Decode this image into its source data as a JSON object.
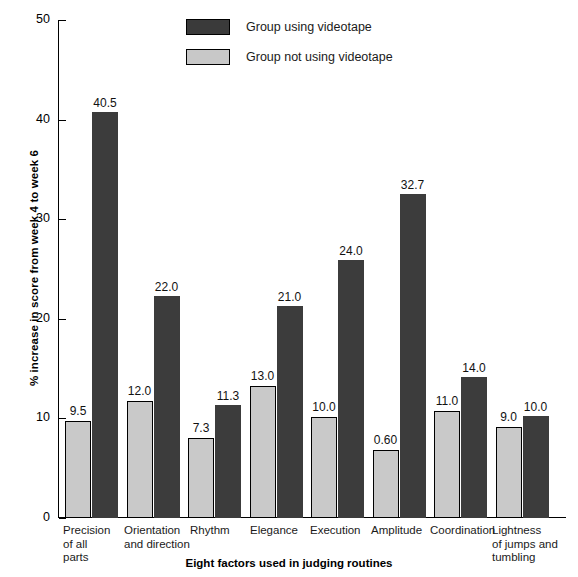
{
  "chart_data": {
    "type": "bar",
    "title": "",
    "xlabel": "Eight factors used in judging routines",
    "ylabel": "% increase in score from week 4 to week 6",
    "ylim": [
      0,
      50
    ],
    "yticks": [
      "0",
      "10",
      "20",
      "30",
      "40",
      "50"
    ],
    "grid": false,
    "legend_position": "top-center",
    "categories": [
      "Precision of all parts",
      "Orientation and direction",
      "Rhythm",
      "Elegance",
      "Execution",
      "Amplitude",
      "Coordination",
      "Lightness of jumps and tumbling"
    ],
    "category_lines": [
      [
        "Precision",
        "of all",
        "parts"
      ],
      [
        "Orientation",
        "and direction"
      ],
      [
        "Rhythm"
      ],
      [
        "Elegance"
      ],
      [
        "Execution"
      ],
      [
        "Amplitude"
      ],
      [
        "Coordination"
      ],
      [
        "Lightness",
        "of jumps and",
        "tumbling"
      ]
    ],
    "series": [
      {
        "name": "Group not using videotape",
        "color": "#c9c9c9",
        "values": [
          9.5,
          12.0,
          7.3,
          13.0,
          10.0,
          0.6,
          11.0,
          9.0
        ],
        "labels": [
          "9.5",
          "12.0",
          "7.3",
          "13.0",
          "10.0",
          "0.60",
          "11.0",
          "9.0"
        ],
        "plotted_heights": [
          9.7,
          11.7,
          8.0,
          13.3,
          10.1,
          6.8,
          10.7,
          9.1
        ]
      },
      {
        "name": "Group using videotape",
        "color": "#3c3c3c",
        "values": [
          40.5,
          22.0,
          11.3,
          21.0,
          24.0,
          32.7,
          14.0,
          10.0
        ],
        "labels": [
          "40.5",
          "22.0",
          "11.3",
          "21.0",
          "24.0",
          "32.7",
          "14.0",
          "10.0"
        ],
        "plotted_heights": [
          40.8,
          22.3,
          11.3,
          21.3,
          25.9,
          32.5,
          14.2,
          10.2
        ]
      }
    ]
  },
  "legend": {
    "items": [
      {
        "label": "Group using videotape",
        "swatch": "dark"
      },
      {
        "label": "Group not using videotape",
        "swatch": "light"
      }
    ]
  },
  "axes": {
    "y_title": "% increase in score from week 4 to week 6",
    "x_title": "Eight factors used in judging routines",
    "y_ticks": [
      {
        "label": "50",
        "value": 50
      },
      {
        "label": "40",
        "value": 40
      },
      {
        "label": "30",
        "value": 30
      },
      {
        "label": "20",
        "value": 20
      },
      {
        "label": "10",
        "value": 10
      },
      {
        "label": "0",
        "value": 0
      }
    ]
  }
}
